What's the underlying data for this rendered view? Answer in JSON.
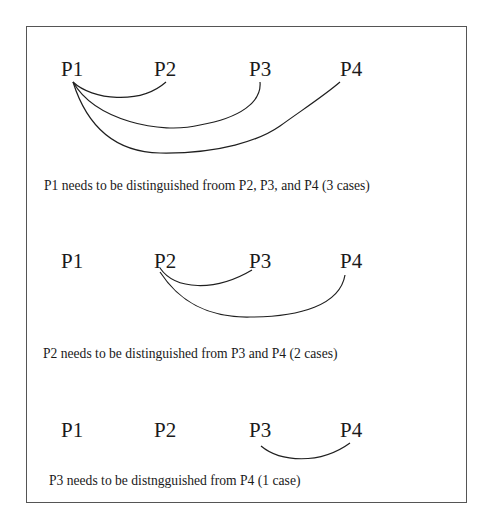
{
  "diagram": {
    "panels": [
      {
        "labels": [
          "P1",
          "P2",
          "P3",
          "P4"
        ],
        "source": "P1",
        "connections": [
          {
            "from": "P1",
            "to": "P2"
          },
          {
            "from": "P1",
            "to": "P3"
          },
          {
            "from": "P1",
            "to": "P4"
          }
        ],
        "caption": "P1 needs to be distinguished froom P2, P3, and P4 (3 cases)"
      },
      {
        "labels": [
          "P1",
          "P2",
          "P3",
          "P4"
        ],
        "source": "P2",
        "connections": [
          {
            "from": "P2",
            "to": "P3"
          },
          {
            "from": "P2",
            "to": "P4"
          }
        ],
        "caption": "P2 needs to be distinguished from P3 and P4 (2 cases)"
      },
      {
        "labels": [
          "P1",
          "P2",
          "P3",
          "P4"
        ],
        "source": "P3",
        "connections": [
          {
            "from": "P3",
            "to": "P4"
          }
        ],
        "caption": "P3 needs to be distngguished from P4 (1 case)"
      }
    ]
  }
}
